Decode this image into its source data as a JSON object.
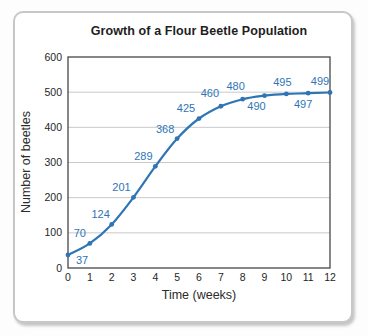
{
  "chart_data": {
    "type": "line",
    "title": "Growth of a Flour Beetle Population",
    "xlabel": "Time (weeks)",
    "ylabel": "Number of beetles",
    "x": [
      0,
      1,
      2,
      3,
      4,
      5,
      6,
      7,
      8,
      9,
      10,
      11,
      12
    ],
    "values": [
      37,
      70,
      124,
      201,
      289,
      368,
      425,
      460,
      480,
      490,
      495,
      497,
      499
    ],
    "point_labels": [
      "37",
      "70",
      "124",
      "201",
      "289",
      "368",
      "425",
      "460",
      "480",
      "490",
      "495",
      "497",
      "499"
    ],
    "xlim": [
      0,
      12
    ],
    "ylim": [
      0,
      600
    ],
    "x_ticks": [
      0,
      1,
      2,
      3,
      4,
      5,
      6,
      7,
      8,
      9,
      10,
      11,
      12
    ],
    "y_ticks": [
      0,
      100,
      200,
      300,
      400,
      500,
      600
    ],
    "grid": "horizontal",
    "legend": "none",
    "label_offsets": [
      [
        14,
        9
      ],
      [
        -10,
        -6
      ],
      [
        -11,
        -6
      ],
      [
        -12,
        -6
      ],
      [
        -12,
        -6
      ],
      [
        -12,
        -6
      ],
      [
        -13,
        -7
      ],
      [
        -11,
        -9
      ],
      [
        -7,
        -9
      ],
      [
        -8,
        14
      ],
      [
        -4,
        -8
      ],
      [
        -5,
        15
      ],
      [
        -10,
        -8
      ]
    ],
    "colors": {
      "line": "#2e75b6",
      "marker": "#2e75b6",
      "point_label": "#2e75b6",
      "grid": "#c9c9c9",
      "axis": "#474747",
      "tick_text": "#262626"
    }
  }
}
